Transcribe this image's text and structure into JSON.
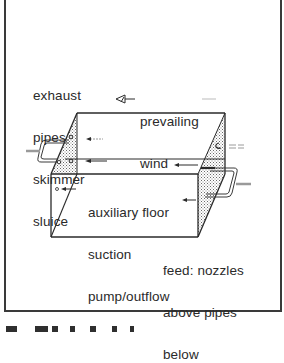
{
  "diagram": {
    "type": "isometric box schematic",
    "labels": {
      "exhaust": [
        "exhaust",
        "pipes",
        "skimmer",
        "sluice"
      ],
      "wind": [
        "prevailing",
        "wind"
      ],
      "auxiliary": [
        "auxiliary floor",
        "suction",
        "pump/outflow"
      ],
      "feed": [
        "feed: nozzles",
        "above pipes",
        "below"
      ]
    },
    "icons": {
      "wind_arrow": "hollow-arrow-left",
      "flow_arrows": "arrow-left"
    },
    "colors": {
      "line": "#2a2a2a",
      "frame": "#3a3a3a",
      "stipple": "#7a7a7a",
      "pipe_stub": "#9a9a9a",
      "background": "#ffffff"
    }
  }
}
